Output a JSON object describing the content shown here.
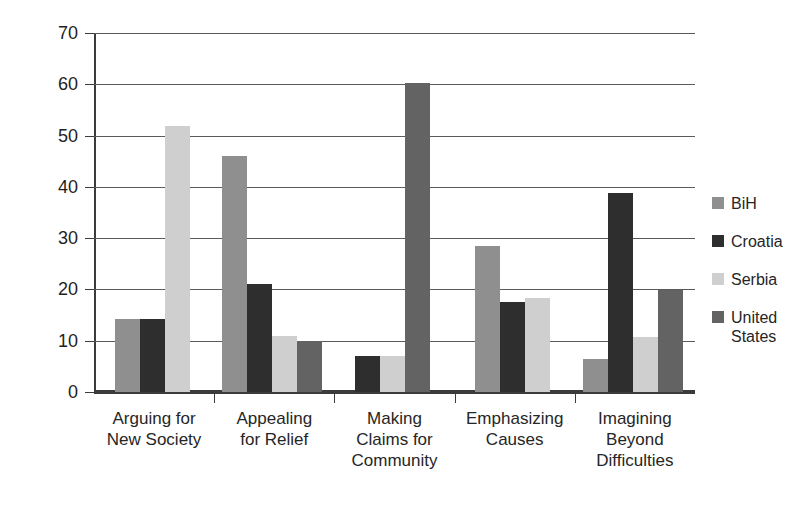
{
  "chart_data": {
    "type": "bar",
    "title": "",
    "xlabel": "",
    "ylabel": "Percentage",
    "ylim": [
      0,
      70
    ],
    "yticks": [
      0,
      10,
      20,
      30,
      40,
      50,
      60,
      70
    ],
    "grid": true,
    "legend_position": "right",
    "categories": [
      "Arguing for\nNew Society",
      "Appealing\nfor Relief",
      "Making\nClaims for\nCommunity",
      "Emphasizing\nCauses",
      "Imagining\nBeyond\nDifficulties"
    ],
    "category_lines": [
      [
        "Arguing for",
        "New Society"
      ],
      [
        "Appealing",
        "for Relief"
      ],
      [
        "Making",
        "Claims for",
        "Community"
      ],
      [
        "Emphasizing",
        "Causes"
      ],
      [
        "Imagining",
        "Beyond",
        "Difficulties"
      ]
    ],
    "series": [
      {
        "name": "BiH",
        "color": "#8f8f8f",
        "values": [
          14.2,
          46.0,
          null,
          28.5,
          6.5
        ]
      },
      {
        "name": "Croatia",
        "color": "#2e2e2e",
        "values": [
          14.2,
          21.0,
          7.0,
          17.6,
          38.8
        ]
      },
      {
        "name": "Serbia",
        "color": "#cfcfcf",
        "values": [
          51.8,
          11.0,
          7.0,
          18.4,
          10.7
        ]
      },
      {
        "name": "United States",
        "color": "#636363",
        "values": [
          null,
          10.0,
          60.2,
          null,
          19.8
        ]
      }
    ]
  },
  "legend": {
    "items": [
      {
        "label": "BiH",
        "lines": [
          "BiH"
        ],
        "color": "#8f8f8f"
      },
      {
        "label": "Croatia",
        "lines": [
          "Croatia"
        ],
        "color": "#2e2e2e"
      },
      {
        "label": "Serbia",
        "lines": [
          "Serbia"
        ],
        "color": "#cfcfcf"
      },
      {
        "label": "United States",
        "lines": [
          "United",
          "States"
        ],
        "color": "#636363"
      }
    ]
  },
  "axis": {
    "y_tick_labels": [
      "0",
      "10",
      "20",
      "30",
      "40",
      "50",
      "60",
      "70"
    ]
  }
}
